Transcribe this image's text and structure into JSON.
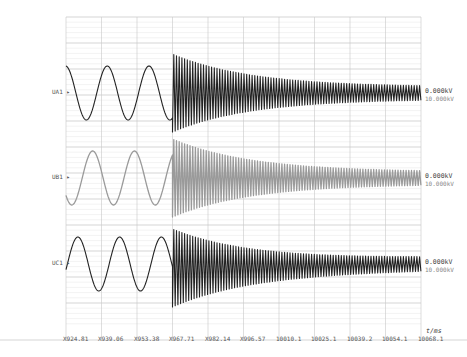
{
  "chart_data": {
    "type": "line",
    "title": "",
    "xlabel": "t/ms",
    "ylabel": "",
    "x_ticks": [
      "X924.81",
      "X939.06",
      "X953.38",
      "X967.71",
      "X982.14",
      "X996.57",
      "10010.1",
      "10025.1",
      "10039.2",
      "10054.1",
      "10068.1"
    ],
    "grid": true,
    "series": [
      {
        "name": "UA1",
        "color": "#222222",
        "value_label": "0.000kV",
        "scale_label": "10.000kV",
        "pre_fault": {
          "type": "sine",
          "cycles": 2.5
        },
        "post_fault": {
          "type": "decaying_oscillation",
          "start_tick_index": 3
        }
      },
      {
        "name": "UB1",
        "color": "#9a9a9a",
        "value_label": "0.000kV",
        "scale_label": "10.000kV",
        "pre_fault": {
          "type": "sine",
          "cycles": 2.5
        },
        "post_fault": {
          "type": "decaying_oscillation",
          "start_tick_index": 3
        }
      },
      {
        "name": "UC1",
        "color": "#222222",
        "value_label": "0.000kV",
        "scale_label": "10.000kV",
        "pre_fault": {
          "type": "sine",
          "cycles": 2.5
        },
        "post_fault": {
          "type": "decaying_oscillation",
          "start_tick_index": 3
        }
      }
    ]
  },
  "channels": [
    {
      "name": "UA1",
      "value": "0.000kV",
      "scale": "10.000kV"
    },
    {
      "name": "UB1",
      "value": "0.000kV",
      "scale": "10.000kV"
    },
    {
      "name": "UC1",
      "value": "0.000kV",
      "scale": "10.000kV"
    }
  ],
  "axis": {
    "unit": "t/ms",
    "ticks": [
      "X924.81",
      "X939.06",
      "X953.38",
      "X967.71",
      "X982.14",
      "X996.57",
      "10010.1",
      "10025.1",
      "10039.2",
      "10054.1",
      "10068.1"
    ]
  },
  "colors": {
    "grid_major": "#c8c8c8",
    "grid_minor": "#e6e6e6",
    "trace_dark": "#1e1e1e",
    "trace_light": "#a0a0a0"
  }
}
